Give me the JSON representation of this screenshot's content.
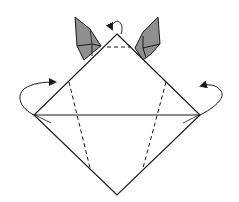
{
  "diagram": {
    "type": "origami-fold-step",
    "title": "",
    "colors": {
      "line": "#1a1a1a",
      "ear_fill": "#8f8f8f",
      "ear_fold": "#b4b4b4",
      "background": "#ffffff"
    },
    "elements": {
      "outline": "square base diamond with horizontal crease",
      "valley_folds": [
        "top dashed crease",
        "left dashed crease",
        "right dashed crease"
      ],
      "ears": [
        "left ear (grey, pleated)",
        "right ear (grey, pleated)"
      ],
      "arrows": [
        "fold behind top point",
        "fold behind left flap",
        "fold behind right flap"
      ]
    }
  }
}
